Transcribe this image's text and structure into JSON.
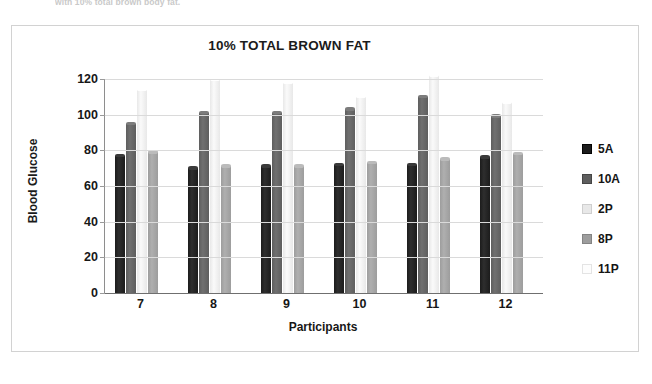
{
  "page": {
    "caption_fragment": "with 10% total brown body fat."
  },
  "chart_data": {
    "type": "bar",
    "title": "10% TOTAL BROWN FAT",
    "xlabel": "Participants",
    "ylabel": "Blood Glucose",
    "categories": [
      "7",
      "8",
      "9",
      "10",
      "11",
      "12"
    ],
    "ylim": [
      0,
      120
    ],
    "yticks": [
      0,
      20,
      40,
      60,
      80,
      100,
      120
    ],
    "grid": true,
    "legend_position": "right",
    "series": [
      {
        "name": "5A",
        "color": "#1c1c1c",
        "values": [
          77,
          70,
          71,
          72,
          72,
          76
        ]
      },
      {
        "name": "10A",
        "color": "#5e5e5e",
        "values": [
          95,
          101,
          101,
          103,
          110,
          99
        ]
      },
      {
        "name": "2P",
        "color": "#e8e8e8",
        "values": [
          114,
          120,
          118,
          110,
          122,
          107
        ]
      },
      {
        "name": "8P",
        "color": "#9d9d9d",
        "values": [
          79,
          71,
          71,
          73,
          75,
          78
        ]
      },
      {
        "name": "11P",
        "color": "#fdfdfd",
        "values": [
          0,
          0,
          0,
          0,
          0,
          0
        ]
      }
    ]
  }
}
